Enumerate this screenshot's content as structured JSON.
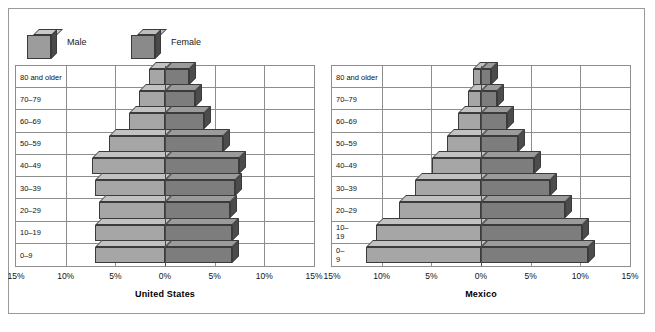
{
  "legend": {
    "items": [
      {
        "label": "Male",
        "icon": "cube-icon",
        "color": "#a6a6a6"
      },
      {
        "label": "Female",
        "icon": "cube-icon",
        "color": "#7d7d7d"
      }
    ]
  },
  "axis": {
    "ticks": [
      "15%",
      "10%",
      "5%",
      "0%",
      "5%",
      "10%",
      "15%"
    ],
    "max": 15,
    "unit": "%"
  },
  "charts": [
    {
      "title": "United States",
      "age_labels": [
        "80 and older",
        "70–79",
        "60–69",
        "50–59",
        "40–49",
        "30–39",
        "20–29",
        "10–19",
        "0–9"
      ]
    },
    {
      "title": "Mexico",
      "age_labels": [
        "80 and older",
        "70–79",
        "60–69",
        "50–59",
        "40–49",
        "30–39",
        "20–29",
        "10–\n19",
        "0–\n9"
      ]
    }
  ],
  "chart_data": [
    {
      "type": "bar",
      "title": "United States",
      "subtitle": "",
      "xlabel": "",
      "ylabel": "",
      "orientation": "horizontal",
      "layout": "population-pyramid",
      "categories": [
        "80 and older",
        "70–79",
        "60–69",
        "50–59",
        "40–49",
        "30–39",
        "20–29",
        "10–19",
        "0–9"
      ],
      "series": [
        {
          "name": "Male",
          "values": [
            1.6,
            2.6,
            3.6,
            5.6,
            7.3,
            7.0,
            6.6,
            7.0,
            7.0
          ]
        },
        {
          "name": "Female",
          "values": [
            2.4,
            3.0,
            3.9,
            5.8,
            7.4,
            7.0,
            6.5,
            6.7,
            6.7
          ]
        }
      ],
      "xlim": [
        -15,
        15
      ],
      "xticks": [
        -15,
        -10,
        -5,
        0,
        5,
        10,
        15
      ],
      "xticklabels": [
        "15%",
        "10%",
        "5%",
        "0%",
        "5%",
        "10%",
        "15%"
      ],
      "grid": true,
      "legend_position": "top-left"
    },
    {
      "type": "bar",
      "title": "Mexico",
      "subtitle": "",
      "xlabel": "",
      "ylabel": "",
      "orientation": "horizontal",
      "layout": "population-pyramid",
      "categories": [
        "80 and older",
        "70–79",
        "60–69",
        "50–59",
        "40–49",
        "30–39",
        "20–29",
        "10–19",
        "0–9"
      ],
      "series": [
        {
          "name": "Male",
          "values": [
            0.8,
            1.3,
            2.3,
            3.4,
            4.9,
            6.6,
            8.3,
            10.6,
            11.6
          ]
        },
        {
          "name": "Female",
          "values": [
            1.0,
            1.6,
            2.6,
            3.7,
            5.3,
            6.9,
            8.5,
            10.2,
            10.8
          ]
        }
      ],
      "xlim": [
        -15,
        15
      ],
      "xticks": [
        -15,
        -10,
        -5,
        0,
        5,
        10,
        15
      ],
      "xticklabels": [
        "15%",
        "10%",
        "5%",
        "0%",
        "5%",
        "10%",
        "15%"
      ],
      "grid": true,
      "legend_position": "top-left"
    }
  ]
}
